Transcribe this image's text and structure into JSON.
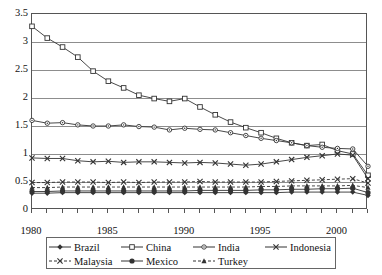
{
  "chart_data": {
    "type": "line",
    "title": "",
    "subtitle": "",
    "xlabel": "",
    "ylabel": "",
    "xlim": [
      1980,
      2002
    ],
    "ylim": [
      0,
      3.5
    ],
    "ytick_step": 0.5,
    "grid": "horizontal",
    "legend_position": "bottom",
    "x": [
      1980,
      1981,
      1982,
      1983,
      1984,
      1985,
      1986,
      1987,
      1988,
      1989,
      1990,
      1991,
      1992,
      1993,
      1994,
      1995,
      1996,
      1997,
      1998,
      1999,
      2000,
      2001,
      2002
    ],
    "xtick_labels": [
      "1980",
      "1985",
      "1990",
      "1995",
      "2000"
    ],
    "xtick_label_values": [
      1980,
      1985,
      1990,
      1995,
      2000
    ],
    "ytick_labels": [
      "0",
      "0.5",
      "1",
      "1.5",
      "2",
      "2.5",
      "3",
      "3.5"
    ],
    "ytick_values": [
      0,
      0.5,
      1,
      1.5,
      2,
      2.5,
      3,
      3.5
    ],
    "series": [
      {
        "name": "Brazil",
        "marker": "filled-diamond",
        "dash": "solid",
        "values": [
          0.3,
          0.3,
          0.31,
          0.31,
          0.31,
          0.31,
          0.31,
          0.31,
          0.31,
          0.31,
          0.31,
          0.31,
          0.31,
          0.31,
          0.31,
          0.31,
          0.31,
          0.32,
          0.32,
          0.32,
          0.32,
          0.32,
          0.26
        ]
      },
      {
        "name": "China",
        "marker": "open-square",
        "dash": "solid",
        "values": [
          3.28,
          3.07,
          2.91,
          2.73,
          2.48,
          2.3,
          2.18,
          2.05,
          1.99,
          1.94,
          1.99,
          1.84,
          1.7,
          1.57,
          1.47,
          1.38,
          1.28,
          1.2,
          1.15,
          1.17,
          1.06,
          1.0,
          0.62
        ]
      },
      {
        "name": "India",
        "marker": "open-circle",
        "dash": "solid",
        "values": [
          1.6,
          1.55,
          1.56,
          1.52,
          1.5,
          1.5,
          1.52,
          1.49,
          1.48,
          1.43,
          1.46,
          1.44,
          1.43,
          1.38,
          1.33,
          1.28,
          1.24,
          1.2,
          1.15,
          1.12,
          1.1,
          1.09,
          0.78
        ]
      },
      {
        "name": "Indonesia",
        "marker": "x-cross",
        "dash": "solid",
        "values": [
          0.93,
          0.92,
          0.92,
          0.88,
          0.86,
          0.87,
          0.85,
          0.86,
          0.86,
          0.85,
          0.84,
          0.85,
          0.84,
          0.82,
          0.8,
          0.82,
          0.86,
          0.9,
          0.94,
          0.97,
          1.0,
          0.98,
          0.56
        ]
      },
      {
        "name": "Malaysia",
        "marker": "x-cross",
        "dash": "dashed",
        "values": [
          0.49,
          0.49,
          0.5,
          0.5,
          0.5,
          0.49,
          0.5,
          0.49,
          0.5,
          0.5,
          0.5,
          0.51,
          0.5,
          0.5,
          0.5,
          0.5,
          0.51,
          0.52,
          0.53,
          0.54,
          0.55,
          0.56,
          0.48
        ]
      },
      {
        "name": "Mexico",
        "marker": "filled-circle",
        "dash": "solid",
        "values": [
          0.33,
          0.33,
          0.34,
          0.34,
          0.34,
          0.34,
          0.34,
          0.34,
          0.34,
          0.34,
          0.34,
          0.35,
          0.35,
          0.35,
          0.35,
          0.36,
          0.36,
          0.37,
          0.37,
          0.38,
          0.38,
          0.39,
          0.31
        ]
      },
      {
        "name": "Turkey",
        "marker": "filled-triangle",
        "dash": "dashed",
        "values": [
          0.4,
          0.4,
          0.41,
          0.41,
          0.41,
          0.41,
          0.41,
          0.41,
          0.41,
          0.41,
          0.41,
          0.41,
          0.41,
          0.41,
          0.41,
          0.42,
          0.42,
          0.43,
          0.43,
          0.43,
          0.43,
          0.44,
          0.4
        ]
      }
    ],
    "colors": {
      "line": "#333333",
      "grid": "#8d8d8d",
      "axis": "#555555",
      "background": "#ffffff"
    }
  },
  "legend": {
    "rows": [
      [
        "Brazil",
        "China",
        "India",
        "Indonesia"
      ],
      [
        "Malaysia",
        "Mexico",
        "Turkey"
      ]
    ]
  }
}
